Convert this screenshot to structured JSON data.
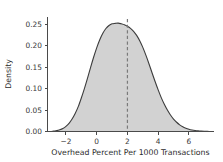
{
  "chart_data": {
    "type": "area",
    "title": "",
    "subtitle": "",
    "xlabel": "Overhead Percent Per 1000 Transactions",
    "ylabel": "Density",
    "xlim": [
      -3.2,
      7.6
    ],
    "ylim": [
      0.0,
      0.268
    ],
    "xticks": [
      -2,
      0,
      2,
      4,
      6
    ],
    "xticklabels": [
      "−2",
      "0",
      "2",
      "4",
      "6"
    ],
    "yticks": [
      0.0,
      0.05,
      0.1,
      0.15,
      0.2,
      0.25
    ],
    "yticklabels": [
      "0.00",
      "0.05",
      "0.10",
      "0.15",
      "0.20",
      "0.25"
    ],
    "grid": false,
    "legend": "none",
    "series": [
      {
        "name": "Density",
        "kind": "kde-filled",
        "fill_color": "#d2d2d2",
        "line_color": "#3c3c3c",
        "x": [
          -3.2,
          -3.0,
          -2.8,
          -2.6,
          -2.4,
          -2.2,
          -2.0,
          -1.8,
          -1.6,
          -1.4,
          -1.2,
          -1.0,
          -0.8,
          -0.6,
          -0.4,
          -0.2,
          0.0,
          0.2,
          0.4,
          0.6,
          0.8,
          1.0,
          1.2,
          1.4,
          1.6,
          1.8,
          2.0,
          2.2,
          2.4,
          2.6,
          2.8,
          3.0,
          3.2,
          3.4,
          3.6,
          3.8,
          4.0,
          4.2,
          4.4,
          4.6,
          4.8,
          5.0,
          5.2,
          5.4,
          5.6,
          5.8,
          6.0,
          6.2,
          6.4,
          6.6,
          6.8,
          7.0,
          7.2,
          7.4,
          7.6
        ],
        "y": [
          0.0,
          0.0,
          0.001,
          0.002,
          0.004,
          0.007,
          0.012,
          0.019,
          0.029,
          0.042,
          0.058,
          0.078,
          0.1,
          0.124,
          0.149,
          0.173,
          0.195,
          0.214,
          0.229,
          0.24,
          0.247,
          0.251,
          0.252,
          0.2525,
          0.251,
          0.249,
          0.2455,
          0.2405,
          0.2335,
          0.224,
          0.2115,
          0.196,
          0.178,
          0.158,
          0.137,
          0.1165,
          0.097,
          0.079,
          0.0635,
          0.05,
          0.0385,
          0.029,
          0.0215,
          0.0155,
          0.011,
          0.0078,
          0.0054,
          0.0036,
          0.0023,
          0.0014,
          0.0008,
          0.0004,
          0.0002,
          0.0001,
          0.0
        ]
      }
    ],
    "annotations": [
      {
        "type": "vline",
        "name": "mean-reference-line",
        "x": 2.0,
        "y_top": 0.262,
        "style": "dashed",
        "color": "#7a7a7a",
        "label": ""
      }
    ],
    "colors": {
      "background": "#ffffff",
      "fill": "#d2d2d2",
      "curve": "#3c3c3c",
      "vline": "#7a7a7a",
      "axis": "#4a4a4a",
      "text": "#2b2b2b"
    }
  }
}
